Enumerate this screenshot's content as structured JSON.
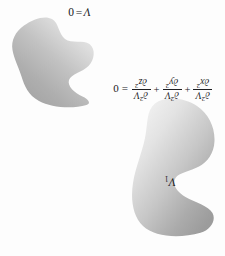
{
  "figure": {
    "type": "textbook-diagram",
    "orientation": "rotated-180",
    "background_color": "#fdfdfd",
    "ink_color": "#17171a"
  },
  "labels": {
    "potential_zero": {
      "variable": "V",
      "equals": "=",
      "value": "0",
      "full_text": "V = 0"
    },
    "conductor_one": {
      "variable": "V",
      "subscript": "1",
      "full_text": "V₁"
    }
  },
  "equation": {
    "name": "laplace-equation",
    "full_text": "∂²V/∂x² + ∂²V/∂y² + ∂²V/∂z² = 0",
    "lhs_prefix": "",
    "terms": [
      {
        "numer_partial": "∂",
        "numer_sup": "2",
        "numer_var": "V",
        "denom_partial": "∂",
        "denom_var": "x",
        "denom_sup": "2"
      },
      {
        "numer_partial": "∂",
        "numer_sup": "2",
        "numer_var": "V",
        "denom_partial": "∂",
        "denom_var": "y",
        "denom_sup": "2"
      },
      {
        "numer_partial": "∂",
        "numer_sup": "2",
        "numer_var": "V",
        "denom_partial": "∂",
        "denom_var": "z",
        "denom_sup": "2"
      }
    ],
    "operators": [
      "+",
      "+"
    ],
    "equals_sign": "=",
    "rhs": "0"
  },
  "shapes": {
    "blob_v_zero": {
      "name": "wavy-boundary-blob",
      "description": "irregular wavy closed region marking the V = 0 boundary surface",
      "gradient_from": "#a9a9a9",
      "gradient_to": "#ececec"
    },
    "blob_v_one": {
      "name": "kidney-conductor-blob",
      "description": "kidney / bean shaped conductor at potential V1 with concave notch on one side",
      "gradient_from": "#9f9f9f",
      "gradient_to": "#f2f2f2"
    }
  }
}
